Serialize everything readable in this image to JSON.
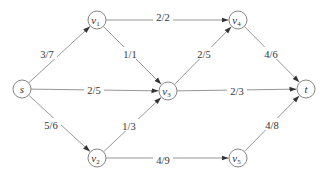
{
  "diagram": {
    "type": "flow-network",
    "nodes": [
      {
        "id": "s",
        "label": "s",
        "sub": "",
        "x": 22,
        "y": 89
      },
      {
        "id": "v1",
        "label": "v",
        "sub": "1",
        "x": 97,
        "y": 20
      },
      {
        "id": "v2",
        "label": "v",
        "sub": "2",
        "x": 97,
        "y": 158
      },
      {
        "id": "v3",
        "label": "v",
        "sub": "3",
        "x": 168,
        "y": 91
      },
      {
        "id": "v4",
        "label": "v",
        "sub": "4",
        "x": 238,
        "y": 20
      },
      {
        "id": "v5",
        "label": "v",
        "sub": "5",
        "x": 238,
        "y": 158
      },
      {
        "id": "t",
        "label": "t",
        "sub": "",
        "x": 306,
        "y": 89
      }
    ],
    "edges": [
      {
        "from": "s",
        "to": "v1",
        "label": "3/7",
        "lx": 47,
        "ly": 54
      },
      {
        "from": "s",
        "to": "v3",
        "label": "2/5",
        "lx": 94,
        "ly": 90
      },
      {
        "from": "s",
        "to": "v2",
        "label": "5/6",
        "lx": 51,
        "ly": 125
      },
      {
        "from": "v1",
        "to": "v4",
        "label": "2/2",
        "lx": 163,
        "ly": 17
      },
      {
        "from": "v1",
        "to": "v3",
        "label": "1/1",
        "lx": 130,
        "ly": 54
      },
      {
        "from": "v2",
        "to": "v3",
        "label": "1/3",
        "lx": 129,
        "ly": 126
      },
      {
        "from": "v2",
        "to": "v5",
        "label": "4/9",
        "lx": 163,
        "ly": 160
      },
      {
        "from": "v3",
        "to": "v4",
        "label": "2/5",
        "lx": 204,
        "ly": 54
      },
      {
        "from": "v3",
        "to": "t",
        "label": "2/3",
        "lx": 237,
        "ly": 91
      },
      {
        "from": "v4",
        "to": "t",
        "label": "4/6",
        "lx": 271,
        "ly": 54
      },
      {
        "from": "v5",
        "to": "t",
        "label": "4/8",
        "lx": 272,
        "ly": 125
      }
    ],
    "node_radius": 9,
    "colors": {
      "stroke": "#777777",
      "edge": "#8a8a8a",
      "text": "#333333",
      "background": "#ffffff"
    }
  }
}
